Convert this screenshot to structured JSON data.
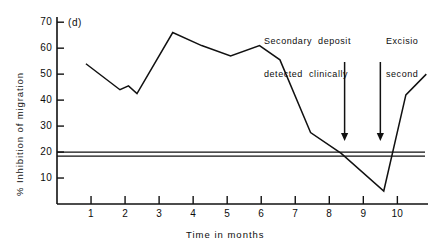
{
  "figure": {
    "panel_label": "(d)",
    "background": "#ffffff",
    "ink_color": "#111111"
  },
  "annotations": [
    {
      "name": "secondary-deposit",
      "line1": "Secondary  deposit",
      "line2": "detected  clinically",
      "arrow_x_month": 8.45
    },
    {
      "name": "excision-second",
      "line1": "Excisio",
      "line2": "second",
      "arrow_x_month": 9.5
    }
  ],
  "reference_lines": [
    {
      "name": "upper-reference-line",
      "value": 20.0
    },
    {
      "name": "lower-reference-line",
      "value": 18.4
    }
  ],
  "chart_data": {
    "type": "line",
    "title": "(d)",
    "xlabel": "Time in months",
    "ylabel": "% Inhibition of migration",
    "xlim": [
      0,
      10.9
    ],
    "ylim": [
      0,
      72
    ],
    "xticks": [
      1,
      2,
      3,
      4,
      5,
      6,
      7,
      8,
      9,
      10
    ],
    "xticklabels": [
      "1",
      "2",
      "3",
      "4",
      "5",
      "6",
      "7",
      "8",
      "9",
      "10"
    ],
    "yticks": [
      10,
      20,
      30,
      40,
      50,
      60,
      70
    ],
    "yticklabels": [
      "10",
      "20",
      "30",
      "40",
      "50",
      "60",
      "70"
    ],
    "grid": false,
    "legend": false,
    "series": [
      {
        "name": "percent-inhibition-of-migration",
        "x": [
          0.85,
          1.85,
          2.1,
          2.35,
          3.4,
          4.25,
          5.1,
          5.95,
          6.55,
          7.45,
          8.35,
          9.6,
          10.25,
          10.85
        ],
        "values": [
          54.0,
          44.0,
          45.5,
          42.5,
          66.0,
          61.0,
          57.0,
          61.0,
          55.5,
          27.5,
          19.5,
          5.0,
          42.0,
          50.0
        ]
      }
    ],
    "reference_values": [
      20.0,
      18.4
    ]
  }
}
